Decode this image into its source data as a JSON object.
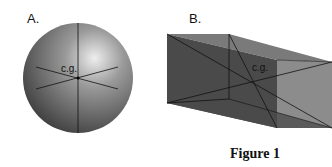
{
  "figure": {
    "caption": "Figure 1",
    "panels": [
      {
        "label": "A.",
        "shape": "sphere",
        "center_label": "c.g."
      },
      {
        "label": "B.",
        "shape": "rectangular box",
        "center_label": "c.g."
      }
    ]
  }
}
